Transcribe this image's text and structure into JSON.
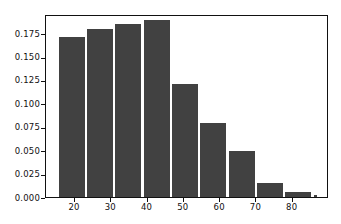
{
  "chart_data": {
    "type": "bar",
    "title": "",
    "xlabel": "",
    "ylabel": "",
    "xlim": [
      12,
      90
    ],
    "ylim": [
      0.0,
      0.1955
    ],
    "grid": false,
    "legend": null,
    "bar_color": "#414141",
    "background_color": "#ffffff",
    "axis_color": "#111111",
    "bin_edges": [
      15.2,
      23.0,
      30.8,
      38.6,
      46.4,
      54.2,
      62.0,
      69.8,
      77.6,
      85.4,
      87.0
    ],
    "categories": [
      "15-23",
      "23-31",
      "31-39",
      "39-46",
      "46-54",
      "54-62",
      "62-70",
      "70-78",
      "78-85",
      "85-87"
    ],
    "bar_centers": [
      19.1,
      26.9,
      34.7,
      42.5,
      50.3,
      58.1,
      65.9,
      73.7,
      81.5,
      86.2
    ],
    "values": [
      0.171,
      0.18,
      0.185,
      0.189,
      0.121,
      0.079,
      0.049,
      0.015,
      0.0055,
      0.0018
    ],
    "xticks": [
      20,
      30,
      40,
      50,
      60,
      70,
      80
    ],
    "xticklabels": [
      "20",
      "30",
      "40",
      "50",
      "60",
      "70",
      "80"
    ],
    "yticks": [
      0.0,
      0.025,
      0.05,
      0.075,
      0.1,
      0.125,
      0.15,
      0.175
    ],
    "yticklabels": [
      "0.000",
      "0.025",
      "0.050",
      "0.075",
      "0.100",
      "0.125",
      "0.150",
      "0.175"
    ]
  }
}
